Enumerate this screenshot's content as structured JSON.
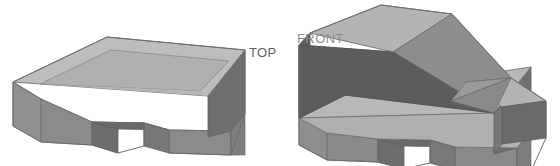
{
  "page": {
    "background_color": "#ffffff",
    "width": 560,
    "height": 166,
    "kind": "cad-isometric-views"
  },
  "labels": {
    "top_view": "TOP",
    "front_view": "FRONT"
  },
  "palette": {
    "top_face": "#b2b2b2",
    "top_face_inner": "#aaaaaa",
    "rim_face": "#bdbdbd",
    "side_face": "#8e8e8e",
    "front_face": "#9a9a9a",
    "dark_face": "#5c5c5c",
    "slope_face": "#777777",
    "notch_face": "#6b6b6b",
    "edge_stroke": "#7a7a7a",
    "outline": "#6e6e6e",
    "label_top_color": "#5e5e5e",
    "label_front_color": "#8e8e8e"
  },
  "views": [
    {
      "id": "left-view",
      "name": "top-view-solid",
      "label": "TOP",
      "description": "Isometric solid: flat rectangular base plate with raised perimeter rim and a rectangular notch cut in the near bottom edge.",
      "faces": {
        "rim_top": "13,82 106,37 244,50 207,95",
        "pocket_top": "39,85 110,50 228,61 199,92",
        "left_side": "13,82 13,125 40,141 40,98",
        "front_lower_left": "40,98 40,141 93,143 93,120",
        "notch_left": "93,120 93,143 118,150 118,127",
        "notch_inner_top": "93,120 118,127 168,128 143,121",
        "notch_right": "143,121 143,144 168,151 168,128",
        "front_lower_right": "168,128 168,151 230,152 230,129",
        "right_side": "207,95 244,50 244,112 207,138"
      }
    },
    {
      "id": "right-view",
      "name": "front-view-solid",
      "label": "FRONT",
      "description": "Isometric solid: same base plate with a wedge block on top whose upper face slopes down from the left end to the right end.",
      "faces": {
        "base_top": "300,138 349,97 520,108 466,152",
        "wedge_top_flat": "308,33 380,5 452,14 392,47",
        "wedge_slope": "392,47 452,14 510,78 451,100",
        "wedge_front_dark": "300,42 308,33 392,47 451,100 451,133 300,120",
        "wedge_left_dark": "300,42 300,120 300,42",
        "right_end_top": "466,84 510,78 545,104 500,110",
        "right_side": "500,110 545,104 545,140 500,150",
        "base_front": "300,120 451,133 500,150 500,110 451,100 300,107",
        "notch": "390,128 410,143 470,144 490,129"
      }
    }
  ]
}
